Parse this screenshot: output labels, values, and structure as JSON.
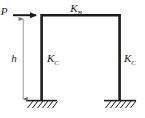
{
  "figure": {
    "width": 145,
    "height": 118,
    "background_color": "#ffffff",
    "line_color": "#1c1c1c",
    "dimension_color": "#9a9a9a"
  },
  "labels": {
    "load": {
      "symbol": "P",
      "subscript": "",
      "x": 6,
      "y": 15
    },
    "beam": {
      "symbol": "K",
      "subscript": "B",
      "x": 76,
      "y": 11
    },
    "left_column": {
      "symbol": "K",
      "subscript": "C",
      "x": 47,
      "y": 58
    },
    "right_column": {
      "symbol": "K",
      "subscript": "C",
      "x": 125,
      "y": 58
    },
    "height_dimension": {
      "symbol": "h",
      "subscript": "",
      "x": 14,
      "y": 61
    }
  },
  "geometry": {
    "beam": {
      "x1": 41,
      "y1": 15,
      "x2": 120,
      "y2": 15
    },
    "left_column": {
      "x1": 41,
      "y1": 15,
      "x2": 41,
      "y2": 100
    },
    "right_column": {
      "x1": 120,
      "y1": 15,
      "x2": 120,
      "y2": 100
    },
    "load_arrow": {
      "x1": 13,
      "y1": 15,
      "x2": 40,
      "y2": 15
    },
    "dimension_line": {
      "x": 23,
      "y1": 18,
      "y2": 100
    },
    "left_support": {
      "cx": 41,
      "y": 100,
      "half_width": 16
    },
    "right_support": {
      "cx": 120,
      "y": 100,
      "half_width": 16
    }
  },
  "elements": {
    "frame_member_label": "frame member",
    "support_label": "fixed support",
    "arrow_label": "point load arrow"
  }
}
